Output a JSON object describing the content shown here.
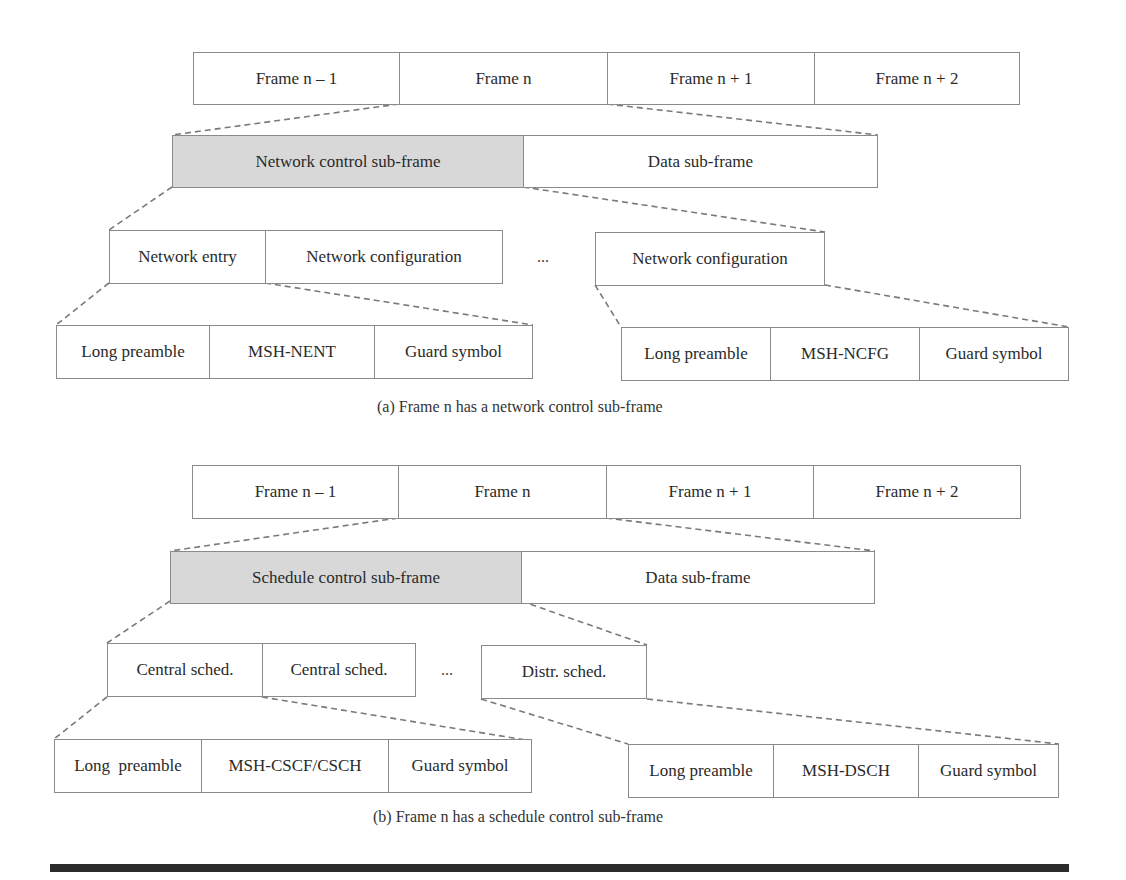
{
  "diagram": {
    "part_a": {
      "frames": [
        "Frame n – 1",
        "Frame n",
        "Frame n + 1",
        "Frame n + 2"
      ],
      "subframes": [
        "Network control sub-frame",
        "Data sub-frame"
      ],
      "mid_left": [
        "Network entry",
        "Network configuration"
      ],
      "mid_ellipsis": "...",
      "mid_right": [
        "Network configuration"
      ],
      "bottom_left": [
        "Long preamble",
        "MSH-NENT",
        "Guard symbol"
      ],
      "bottom_right": [
        "Long preamble",
        "MSH-NCFG",
        "Guard symbol"
      ],
      "caption": "(a) Frame n has a network control sub-frame"
    },
    "part_b": {
      "frames": [
        "Frame n – 1",
        "Frame n",
        "Frame n + 1",
        "Frame n + 2"
      ],
      "subframes": [
        "Schedule control sub-frame",
        "Data sub-frame"
      ],
      "mid_left": [
        "Central sched.",
        "Central sched."
      ],
      "mid_ellipsis": "...",
      "mid_right": [
        "Distr. sched."
      ],
      "bottom_left": [
        "Long  preamble",
        "MSH-CSCF/CSCH",
        "Guard symbol"
      ],
      "bottom_right": [
        "Long preamble",
        "MSH-DSCH",
        "Guard symbol"
      ],
      "caption": "(b) Frame n has a schedule control sub-frame"
    },
    "colors": {
      "shaded_cell": "#d8d8d8",
      "border": "#8a8a8a",
      "dashed_connector": "#7a7a7a",
      "rule": "#2b2b2b"
    }
  }
}
